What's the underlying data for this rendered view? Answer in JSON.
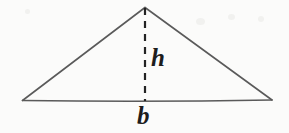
{
  "figure": {
    "name": "triangle-area-diagram",
    "background_color": "#fbfbfa",
    "outline_color": "#5a5a5a",
    "altitude_color": "#232323",
    "label_color": "#1d1d1d"
  },
  "labels": {
    "height": "h",
    "base": "b"
  },
  "geometry": {
    "apex": {
      "x": 145,
      "y": 7
    },
    "left_vertex": {
      "x": 22,
      "y": 100
    },
    "right_vertex": {
      "x": 272,
      "y": 100
    },
    "altitude_foot": {
      "x": 145,
      "y": 100
    },
    "base_length_px": 250,
    "height_length_px": 93,
    "outline_stroke_width": 1.6,
    "altitude_stroke_width": 2.2,
    "altitude_dash_pattern": "7 6"
  }
}
